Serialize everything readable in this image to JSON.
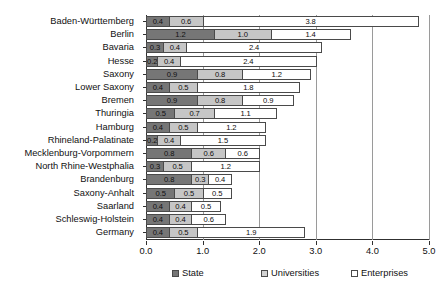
{
  "chart_data": {
    "type": "bar",
    "orientation": "horizontal",
    "stacked": true,
    "title": "",
    "subtitle": "",
    "xlabel": "",
    "ylabel": "",
    "xlim": [
      0.0,
      5.0
    ],
    "xticks": [
      "0.0",
      "1.0",
      "2.0",
      "3.0",
      "4.0",
      "5.0"
    ],
    "xtick_values": [
      0.0,
      1.0,
      2.0,
      3.0,
      4.0,
      5.0
    ],
    "grid": "vertical",
    "legend_position": "bottom",
    "categories": [
      "Baden-Württemberg",
      "Berlin",
      "Bavaria",
      "Hesse",
      "Saxony",
      "Lower Saxony",
      "Bremen",
      "Thuringia",
      "Hamburg",
      "Rhineland-Palatinate",
      "Mecklenburg-Vorpommern",
      "North Rhine-Westphalia",
      "Brandenburg",
      "Saxony-Anhalt",
      "Saarland",
      "Schleswig-Holstein",
      "Germany"
    ],
    "series": [
      {
        "name": "State",
        "color": "#767676",
        "values": [
          0.4,
          1.2,
          0.3,
          0.2,
          0.9,
          0.4,
          0.9,
          0.5,
          0.4,
          0.2,
          0.8,
          0.3,
          0.8,
          0.5,
          0.4,
          0.4,
          0.4
        ],
        "labels": [
          "0.4",
          "1.2",
          "0.3",
          "0.2",
          "0.9",
          "0.4",
          "0.9",
          "0.5",
          "0.4",
          "0.2",
          "0.8",
          "0.3",
          "0.8",
          "0.5",
          "0.4",
          "0.4",
          "0.4"
        ]
      },
      {
        "name": "Universities",
        "color": "#c6c6c6",
        "values": [
          0.6,
          1.0,
          0.4,
          0.4,
          0.8,
          0.5,
          0.8,
          0.7,
          0.5,
          0.4,
          0.6,
          0.5,
          0.3,
          0.5,
          0.4,
          0.4,
          0.5
        ],
        "labels": [
          "0.6",
          "1.0",
          "0.4",
          "0.4",
          "0.8",
          "0.5",
          "0.8",
          "0.7",
          "0.5",
          "0.4",
          "0.6",
          "0.5",
          "0.3",
          "0.5",
          "0.4",
          "0.4",
          "0.5"
        ]
      },
      {
        "name": "Enterprises",
        "color": "#ffffff",
        "values": [
          3.8,
          1.4,
          2.4,
          2.4,
          1.2,
          1.8,
          0.9,
          1.1,
          1.2,
          1.5,
          0.6,
          1.2,
          0.4,
          0.5,
          0.5,
          0.6,
          1.9
        ],
        "labels": [
          "3.8",
          "1.4",
          "2.4",
          "2.4",
          "1.2",
          "1.8",
          "0.9",
          "1.1",
          "1.2",
          "1.5",
          "0.6",
          "1.2",
          "0.4",
          "0.5",
          "0.5",
          "0.6",
          "1.9"
        ]
      }
    ],
    "totals": [
      4.8,
      3.6,
      3.1,
      3.0,
      2.9,
      2.7,
      2.6,
      2.3,
      2.1,
      2.1,
      2.0,
      2.0,
      1.5,
      1.5,
      1.3,
      1.4,
      2.8
    ]
  },
  "legend": {
    "items": [
      {
        "label": "State",
        "key": "state"
      },
      {
        "label": "Universities",
        "key": "universities"
      },
      {
        "label": "Enterprises",
        "key": "enterprises"
      }
    ]
  }
}
